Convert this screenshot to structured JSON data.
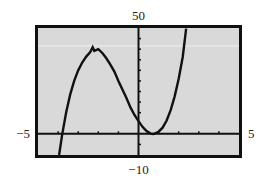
{
  "chart_data": {
    "type": "line",
    "title": "",
    "xlabel": "",
    "ylabel": "",
    "xlim": [
      -5,
      5
    ],
    "ylim": [
      -10,
      50
    ],
    "x_tick_step": 1,
    "y_tick_step": 5,
    "window_labels": {
      "xmin": "−5",
      "xmax": "5",
      "ymin": "−10",
      "ymax": "50"
    },
    "grid": false,
    "legend": "none",
    "series": [
      {
        "name": "f(x)",
        "x": [
          -3.95,
          -3.8,
          -3.6,
          -3.4,
          -3.2,
          -3.0,
          -2.8,
          -2.6,
          -2.4,
          -2.28,
          -2.2,
          -2.0,
          -1.8,
          -1.6,
          -1.4,
          -1.2,
          -1.0,
          -0.8,
          -0.6,
          -0.4,
          -0.2,
          0.0,
          0.2,
          0.4,
          0.6,
          0.73,
          0.8,
          1.0,
          1.2,
          1.4,
          1.6,
          1.8,
          2.0,
          2.2,
          2.37
        ],
        "y": [
          -10.4,
          -0.5,
          10.1,
          18.5,
          25.0,
          30.0,
          33.7,
          36.5,
          38.6,
          40.9,
          39.2,
          40.0,
          38.2,
          35.7,
          32.7,
          29.4,
          25.0,
          20.9,
          16.9,
          12.5,
          8.9,
          6.0,
          3.3,
          1.3,
          0.1,
          -0.05,
          0.1,
          1.0,
          2.9,
          6.3,
          11.2,
          17.7,
          26.0,
          36.3,
          49.7
        ]
      }
    ],
    "colors": {
      "frame": "#111111",
      "plot_background": "#d9d9d9",
      "curve": "#111111",
      "axes": "#111111"
    }
  }
}
